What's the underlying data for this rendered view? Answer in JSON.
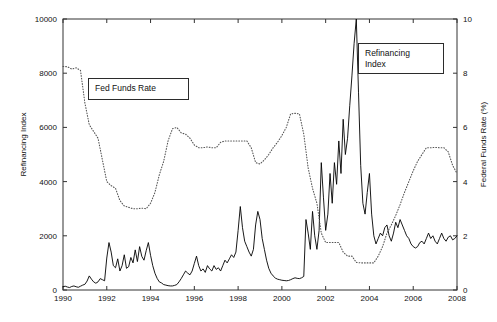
{
  "chart_data": {
    "type": "line",
    "title": "",
    "xlabel": "",
    "ylabel": "Refinancing Index",
    "ylabel_right": "Federal Funds Rate (%)",
    "xlim": [
      1990,
      2008
    ],
    "ylim": [
      0,
      10000
    ],
    "ylim_right": [
      0,
      10
    ],
    "grid": false,
    "legend_position": "inside-annotations",
    "xticks": [
      "1990",
      "1992",
      "1994",
      "1996",
      "1998",
      "2000",
      "2002",
      "2004",
      "2006",
      "2008"
    ],
    "xtick_values": [
      1990,
      1992,
      1994,
      1996,
      1998,
      2000,
      2002,
      2004,
      2006,
      2008
    ],
    "yticks_left": [
      "0",
      "2000",
      "4000",
      "6000",
      "8000",
      "10000"
    ],
    "ytick_values_left": [
      0,
      2000,
      4000,
      6000,
      8000,
      10000
    ],
    "yticks_right": [
      "0",
      "2",
      "4",
      "6",
      "8",
      "10"
    ],
    "ytick_values_right": [
      0,
      2,
      4,
      6,
      8,
      10
    ],
    "annotations": [
      {
        "text": "Fed Funds Rate",
        "series": "fed_funds_rate"
      },
      {
        "text": "Refinancing\nIndex",
        "series": "refinancing_index"
      }
    ],
    "series": [
      {
        "name": "Refinancing Index",
        "axis": "left",
        "style": "solid",
        "color": "#000000",
        "x": [
          1990.0,
          1990.1,
          1990.2,
          1990.3,
          1990.4,
          1990.5,
          1990.6,
          1990.7,
          1990.8,
          1990.9,
          1991.0,
          1991.1,
          1991.2,
          1991.3,
          1991.4,
          1991.5,
          1991.6,
          1991.7,
          1991.8,
          1991.9,
          1992.0,
          1992.1,
          1992.2,
          1992.3,
          1992.4,
          1992.5,
          1992.6,
          1992.7,
          1992.8,
          1992.9,
          1993.0,
          1993.1,
          1993.2,
          1993.3,
          1993.4,
          1993.5,
          1993.6,
          1993.7,
          1993.8,
          1993.9,
          1994.0,
          1994.1,
          1994.2,
          1994.3,
          1994.4,
          1994.5,
          1994.6,
          1994.7,
          1994.8,
          1994.9,
          1995.0,
          1995.1,
          1995.2,
          1995.3,
          1995.4,
          1995.5,
          1995.6,
          1995.7,
          1995.8,
          1995.9,
          1996.0,
          1996.1,
          1996.2,
          1996.3,
          1996.4,
          1996.5,
          1996.6,
          1996.7,
          1996.8,
          1996.9,
          1997.0,
          1997.1,
          1997.2,
          1997.3,
          1997.4,
          1997.5,
          1997.6,
          1997.7,
          1997.8,
          1997.9,
          1998.0,
          1998.1,
          1998.2,
          1998.3,
          1998.4,
          1998.5,
          1998.6,
          1998.7,
          1998.8,
          1998.9,
          1999.0,
          1999.1,
          1999.2,
          1999.3,
          1999.4,
          1999.5,
          1999.6,
          1999.7,
          1999.8,
          1999.9,
          2000.0,
          2000.1,
          2000.2,
          2000.3,
          2000.4,
          2000.5,
          2000.6,
          2000.7,
          2000.8,
          2000.9,
          2001.0,
          2001.1,
          2001.2,
          2001.3,
          2001.4,
          2001.5,
          2001.6,
          2001.7,
          2001.8,
          2001.9,
          2002.0,
          2002.1,
          2002.2,
          2002.3,
          2002.4,
          2002.5,
          2002.6,
          2002.7,
          2002.8,
          2002.9,
          2003.0,
          2003.1,
          2003.2,
          2003.3,
          2003.4,
          2003.5,
          2003.6,
          2003.7,
          2003.8,
          2003.9,
          2004.0,
          2004.1,
          2004.2,
          2004.3,
          2004.4,
          2004.5,
          2004.6,
          2004.7,
          2004.8,
          2004.9,
          2005.0,
          2005.1,
          2005.2,
          2005.3,
          2005.4,
          2005.5,
          2005.6,
          2005.7,
          2005.8,
          2005.9,
          2006.0,
          2006.1,
          2006.2,
          2006.3,
          2006.4,
          2006.5,
          2006.6,
          2006.7,
          2006.8,
          2006.9,
          2007.0,
          2007.1,
          2007.2,
          2007.3,
          2007.4,
          2007.5,
          2007.6,
          2007.7,
          2007.8,
          2007.9,
          2008.0
        ],
        "y": [
          120,
          140,
          110,
          90,
          130,
          150,
          120,
          100,
          140,
          180,
          210,
          330,
          520,
          400,
          300,
          250,
          300,
          420,
          380,
          340,
          1180,
          1750,
          1400,
          900,
          820,
          1150,
          700,
          900,
          1300,
          800,
          860,
          1200,
          1000,
          1480,
          1050,
          1600,
          1240,
          1100,
          1450,
          1750,
          1280,
          900,
          620,
          430,
          300,
          260,
          200,
          180,
          160,
          150,
          150,
          170,
          200,
          300,
          420,
          560,
          700,
          620,
          560,
          700,
          980,
          1250,
          900,
          700,
          780,
          650,
          900,
          780,
          700,
          900,
          760,
          820,
          700,
          900,
          1100,
          1000,
          1150,
          1300,
          1200,
          1400,
          2200,
          3080,
          2300,
          1800,
          1600,
          1400,
          1250,
          1500,
          2400,
          2900,
          2600,
          1900,
          1500,
          1100,
          800,
          620,
          520,
          440,
          400,
          380,
          360,
          350,
          340,
          350,
          380,
          420,
          450,
          430,
          420,
          450,
          500,
          2600,
          2100,
          1500,
          2900,
          2000,
          1500,
          2200,
          4700,
          3400,
          2200,
          2800,
          4300,
          3200,
          4700,
          3900,
          5500,
          4300,
          6300,
          5000,
          5600,
          6800,
          7900,
          9100,
          10000,
          7300,
          4600,
          3200,
          2800,
          3600,
          4300,
          2800,
          2000,
          1700,
          1900,
          2100,
          2000,
          2300,
          2400,
          2000,
          1800,
          2100,
          2500,
          2300,
          2600,
          2400,
          2200,
          2000,
          1900,
          1700,
          1600,
          1550,
          1600,
          1750,
          1800,
          1700,
          1900,
          2100,
          1900,
          2000,
          1800,
          1700,
          1900,
          2100,
          1900,
          1800,
          1950,
          2000,
          1850,
          1900,
          2000
        ]
      },
      {
        "name": "Fed Funds Rate",
        "axis": "right",
        "style": "dotted",
        "color": "#555555",
        "x": [
          1990.0,
          1990.2,
          1990.4,
          1990.6,
          1990.8,
          1991.0,
          1991.2,
          1991.4,
          1991.6,
          1991.8,
          1992.0,
          1992.2,
          1992.4,
          1992.6,
          1992.8,
          1993.0,
          1993.2,
          1993.4,
          1993.6,
          1993.8,
          1994.0,
          1994.2,
          1994.4,
          1994.6,
          1994.8,
          1995.0,
          1995.2,
          1995.4,
          1995.6,
          1995.8,
          1996.0,
          1996.2,
          1996.4,
          1996.6,
          1996.8,
          1997.0,
          1997.2,
          1997.4,
          1997.6,
          1997.8,
          1998.0,
          1998.2,
          1998.4,
          1998.6,
          1998.8,
          1999.0,
          1999.2,
          1999.4,
          1999.6,
          1999.8,
          2000.0,
          2000.2,
          2000.4,
          2000.6,
          2000.8,
          2001.0,
          2001.2,
          2001.4,
          2001.6,
          2001.8,
          2002.0,
          2002.2,
          2002.4,
          2002.6,
          2002.8,
          2003.0,
          2003.2,
          2003.4,
          2003.6,
          2003.8,
          2004.0,
          2004.2,
          2004.4,
          2004.6,
          2004.8,
          2005.0,
          2005.2,
          2005.4,
          2005.6,
          2005.8,
          2006.0,
          2006.2,
          2006.4,
          2006.6,
          2006.8,
          2007.0,
          2007.2,
          2007.4,
          2007.6,
          2007.8,
          2008.0
        ],
        "y": [
          8.25,
          8.24,
          8.15,
          8.2,
          8.1,
          6.9,
          6.1,
          5.85,
          5.6,
          4.8,
          4.0,
          3.85,
          3.75,
          3.3,
          3.1,
          3.05,
          3.0,
          3.0,
          3.02,
          3.0,
          3.2,
          3.6,
          4.25,
          4.75,
          5.5,
          5.95,
          6.0,
          5.8,
          5.75,
          5.6,
          5.35,
          5.25,
          5.25,
          5.28,
          5.25,
          5.25,
          5.45,
          5.5,
          5.5,
          5.5,
          5.5,
          5.5,
          5.5,
          5.25,
          4.7,
          4.65,
          4.8,
          5.0,
          5.25,
          5.45,
          5.7,
          6.0,
          6.5,
          6.52,
          6.5,
          5.75,
          4.5,
          3.75,
          3.2,
          2.1,
          1.75,
          1.75,
          1.75,
          1.75,
          1.4,
          1.25,
          1.25,
          1.02,
          1.0,
          1.0,
          1.0,
          1.0,
          1.25,
          1.6,
          2.1,
          2.4,
          2.75,
          3.15,
          3.6,
          4.0,
          4.4,
          4.75,
          5.0,
          5.25,
          5.25,
          5.26,
          5.25,
          5.25,
          5.1,
          4.6,
          4.3
        ]
      }
    ]
  }
}
